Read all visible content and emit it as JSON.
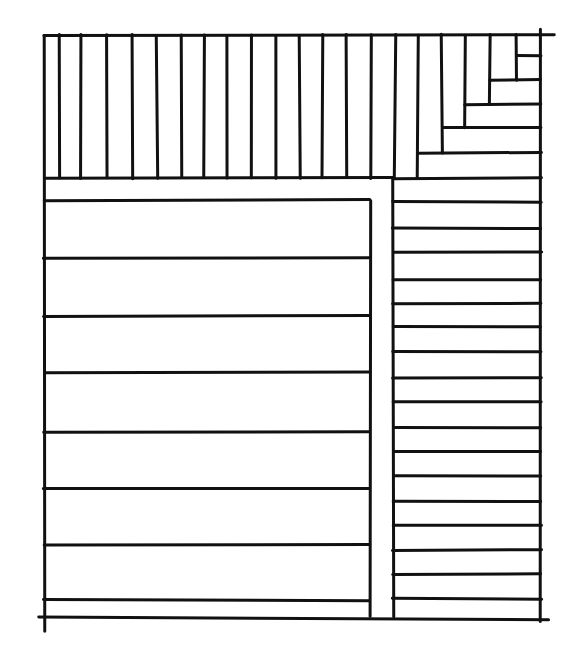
{
  "drawing": {
    "style": "hand-drawn ink sketch",
    "stroke_color": "#111111",
    "background_color": "#ffffff",
    "frame": {
      "left": 44,
      "top": 35,
      "right": 541,
      "bottom": 617
    },
    "top_band": {
      "bottom": 178,
      "vertical_lines_x": [
        59,
        81,
        107,
        132,
        157,
        182,
        204,
        227,
        252,
        276,
        300,
        322,
        346,
        371,
        395,
        418
      ]
    },
    "staircase": {
      "verticals": [
        {
          "x": 442,
          "y1": 35,
          "y2": 153
        },
        {
          "x": 465,
          "y1": 35,
          "y2": 128
        },
        {
          "x": 490,
          "y1": 35,
          "y2": 104
        },
        {
          "x": 516,
          "y1": 35,
          "y2": 80
        }
      ],
      "horizontals": [
        {
          "y": 55,
          "x1": 516,
          "x2": 541
        },
        {
          "y": 80,
          "x1": 490,
          "x2": 541
        },
        {
          "y": 104,
          "x1": 465,
          "x2": 541
        },
        {
          "y": 128,
          "x1": 442,
          "x2": 541
        },
        {
          "y": 153,
          "x1": 418,
          "x2": 541
        }
      ]
    },
    "left_panel": {
      "x1": 44,
      "x2": 370,
      "top": 200,
      "bottom": 617,
      "horizontal_lines_y": [
        200,
        258,
        316,
        372,
        432,
        488,
        545,
        600
      ]
    },
    "right_column": {
      "x1": 393,
      "x2": 541,
      "top": 178,
      "bottom": 617,
      "horizontal_lines_y": [
        202,
        228,
        252,
        279,
        304,
        327,
        352,
        378,
        402,
        427,
        451,
        476,
        502,
        525,
        550,
        574,
        599
      ]
    }
  }
}
